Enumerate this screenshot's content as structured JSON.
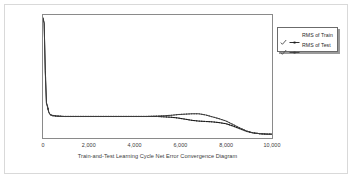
{
  "chart_data": {
    "type": "line",
    "title": "Train-and-Test Learning Cycle Net Error Convergence Diagram",
    "xlabel": "",
    "ylabel": "",
    "xlim": [
      0,
      10000
    ],
    "ylim": [
      0,
      0.32
    ],
    "grid": false,
    "legend_position": "right",
    "xticks": [
      "0",
      "2,000",
      "4,000",
      "6,000",
      "8,000",
      "10,000"
    ],
    "xtick_values": [
      0,
      2000,
      4000,
      6000,
      8000,
      10000
    ],
    "yticks": [
      "0.05",
      "0.1",
      "0.15",
      "0.2",
      "0.25",
      "0.3"
    ],
    "ytick_values": [
      0.05,
      0.1,
      0.15,
      0.2,
      0.25,
      0.3
    ],
    "series": [
      {
        "name": "RMS of Train",
        "color": "#1a1a1a",
        "marker": "dash-dot",
        "x": [
          0,
          50,
          100,
          150,
          200,
          250,
          300,
          400,
          600,
          900,
          1200,
          1600,
          2000,
          2500,
          3000,
          3500,
          4000,
          4500,
          5000,
          5300,
          5600,
          5900,
          6200,
          6500,
          6800,
          7100,
          7400,
          7700,
          8000,
          8300,
          8600,
          8900,
          9200,
          9500,
          9800,
          10000
        ],
        "values": [
          0.312,
          0.3,
          0.175,
          0.092,
          0.082,
          0.068,
          0.062,
          0.059,
          0.057,
          0.056,
          0.056,
          0.056,
          0.056,
          0.056,
          0.056,
          0.056,
          0.056,
          0.056,
          0.056,
          0.055,
          0.054,
          0.052,
          0.049,
          0.046,
          0.044,
          0.043,
          0.042,
          0.04,
          0.037,
          0.031,
          0.024,
          0.017,
          0.013,
          0.011,
          0.01,
          0.01
        ]
      },
      {
        "name": "RMS of Test",
        "color": "#3d3d3d",
        "marker": "dash-dot",
        "x": [
          0,
          50,
          100,
          150,
          200,
          250,
          300,
          400,
          600,
          900,
          1200,
          1600,
          2000,
          2500,
          3000,
          3500,
          4000,
          4500,
          5000,
          5300,
          5600,
          5900,
          6200,
          6500,
          6800,
          7100,
          7400,
          7700,
          8000,
          8300,
          8600,
          8900,
          9200,
          9500,
          9800,
          10000
        ],
        "values": [
          0.31,
          0.298,
          0.172,
          0.09,
          0.08,
          0.067,
          0.061,
          0.058,
          0.057,
          0.056,
          0.056,
          0.056,
          0.056,
          0.056,
          0.056,
          0.056,
          0.056,
          0.056,
          0.057,
          0.058,
          0.059,
          0.061,
          0.062,
          0.063,
          0.063,
          0.06,
          0.055,
          0.05,
          0.044,
          0.035,
          0.026,
          0.018,
          0.013,
          0.011,
          0.01,
          0.01
        ]
      }
    ]
  },
  "legend": {
    "items": [
      {
        "check": "✔",
        "label": "RMS of Train"
      },
      {
        "check": "✔",
        "label": "RMS of Test"
      }
    ]
  }
}
